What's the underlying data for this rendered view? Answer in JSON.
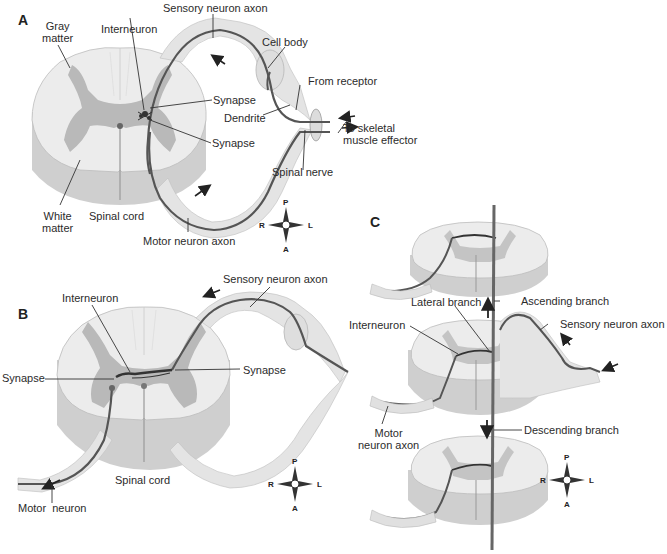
{
  "colors": {
    "white_matter": "#ececec",
    "white_matter_side": "#cfcfcf",
    "gray_matter": "#b9b9b9",
    "nerve_sheath": "#e6e6e6",
    "neuron_fiber": "#555555",
    "label_text": "#2b2b2b"
  },
  "panels": {
    "a": {
      "letter": "A",
      "labels": {
        "gray_matter": "Gray\nmatter",
        "gray_matter_1": "Gray",
        "gray_matter_2": "matter",
        "interneuron": "Interneuron",
        "sensory_neuron_axon": "Sensory neuron axon",
        "cell_body": "Cell body",
        "from_receptor": "From receptor",
        "synapse_1": "Synapse",
        "dendrite": "Dendrite",
        "synapse_2": "Synapse",
        "to_effector_1": "To skeletal",
        "to_effector_2": "muscle effector",
        "spinal_nerve": "Spinal nerve",
        "white_matter_1": "White",
        "white_matter_2": "matter",
        "spinal_cord": "Spinal cord",
        "motor_neuron_axon": "Motor neuron axon"
      },
      "compass": {
        "top": "P",
        "bottom": "A",
        "left": "R",
        "right": "L"
      }
    },
    "b": {
      "letter": "B",
      "labels": {
        "sensory_neuron_axon": "Sensory neuron axon",
        "interneuron": "Interneuron",
        "synapse_left": "Synapse",
        "synapse_right": "Synapse",
        "spinal_cord": "Spinal cord",
        "motor_neuron": "Motor  neuron"
      },
      "compass": {
        "top": "P",
        "bottom": "A",
        "left": "R",
        "right": "L"
      }
    },
    "c": {
      "letter": "C",
      "labels": {
        "lateral_branch": "Lateral branch",
        "ascending_branch": "Ascending branch",
        "interneuron": "Interneuron",
        "sensory_neuron_axon": "Sensory neuron axon",
        "motor_neuron_axon_1": "Motor",
        "motor_neuron_axon_2": "neuron axon",
        "descending_branch": "Descending branch"
      },
      "compass": {
        "top": "P",
        "bottom": "A",
        "left": "R",
        "right": "L"
      }
    }
  }
}
